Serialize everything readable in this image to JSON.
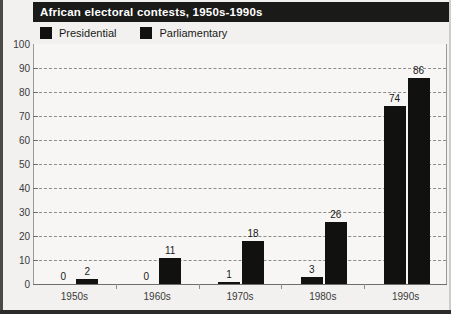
{
  "chart_data": {
    "type": "bar",
    "title": "African electoral contests, 1950s-1990s",
    "xlabel": "",
    "ylabel": "",
    "ylim": [
      0,
      100
    ],
    "yticks": [
      0,
      10,
      20,
      30,
      40,
      50,
      60,
      70,
      80,
      90,
      100
    ],
    "grid": true,
    "legend_position": "top-left",
    "categories": [
      "1950s",
      "1960s",
      "1970s",
      "1980s",
      "1990s"
    ],
    "series": [
      {
        "name": "Presidential",
        "color": "#111110",
        "values": [
          0,
          0,
          1,
          3,
          74
        ]
      },
      {
        "name": "Parliamentary",
        "color": "#111110",
        "values": [
          2,
          11,
          18,
          26,
          86
        ]
      }
    ],
    "value_labels": [
      "0",
      "2",
      "0",
      "11",
      "1",
      "18",
      "3",
      "26",
      "74",
      "86"
    ]
  },
  "colors": {
    "bar": "#111110",
    "title_bar_background": "#1a1a18",
    "title_text": "#ffffff",
    "plot_background": "#f7f6f4",
    "page_background": "#f2f1ef",
    "gridline": "#8d8d89",
    "axis": "#6e6e6b"
  }
}
